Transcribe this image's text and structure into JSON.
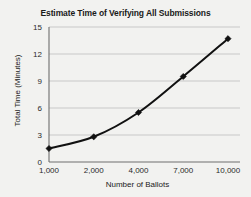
{
  "chart_data": {
    "type": "line",
    "title": "Estimate Time of Verifying All Submissions",
    "xlabel": "Number of Ballots",
    "ylabel": "Total Time (Minutes)",
    "categories": [
      "1,000",
      "2,000",
      "4,000",
      "7,000",
      "10,000"
    ],
    "x_numeric": [
      1000,
      2000,
      4000,
      7000,
      10000
    ],
    "values": [
      1.5,
      2.8,
      5.5,
      9.5,
      13.7
    ],
    "series": [
      {
        "name": "Total Time",
        "values": [
          1.5,
          2.8,
          5.5,
          9.5,
          13.7
        ]
      }
    ],
    "ylim": [
      0,
      15
    ],
    "yticks": [
      0,
      3,
      6,
      9,
      12,
      15
    ],
    "ytick_labels": [
      "0",
      "3",
      "6",
      "9",
      "12",
      "15"
    ],
    "xtick_labels": [
      "1,000",
      "2,000",
      "4,000",
      "7,000",
      "10,000"
    ],
    "grid": "horizontal",
    "legend": "none",
    "marker": "diamond",
    "line_color": "#111111",
    "grid_color": "#b8b8b8",
    "axis_color": "#6e6e6e",
    "background_color": "#f2f2f0",
    "x_axis_scale": "categorical"
  }
}
